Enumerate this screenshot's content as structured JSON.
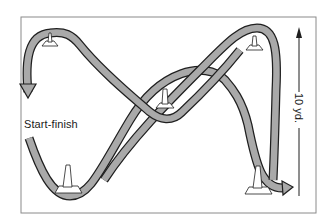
{
  "figure": {
    "type": "cone drill path diagram",
    "labels": {
      "start_finish": "Start-finish",
      "distance": "10 yd."
    },
    "cones": [
      {
        "id": "top-left",
        "position": "top left"
      },
      {
        "id": "center",
        "position": "center"
      },
      {
        "id": "top-right",
        "position": "top right"
      },
      {
        "id": "bottom-left",
        "position": "bottom left"
      },
      {
        "id": "bottom-right",
        "position": "bottom right"
      }
    ],
    "colors": {
      "path_fill": "#a9a9a9",
      "path_stroke": "#1f1f1f",
      "frame": "#8a8a8a",
      "cone_fill": "#ffffff",
      "background": "#ffffff"
    }
  }
}
